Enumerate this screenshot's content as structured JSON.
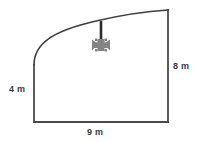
{
  "figure": {
    "background_color": "#ffffff",
    "outline_color": "#4a4a4a",
    "marker_color": "#808080",
    "text_color": "#3a3a3a",
    "labels": {
      "left_side": "4 m",
      "right_side": "8 m",
      "bottom_side": "9 m"
    },
    "icons": {
      "pointer_line": "vertical-pointer-line",
      "burst": "star-burst-marker"
    },
    "geometry": {
      "bottom_left": [
        34,
        122
      ],
      "bottom_right": [
        168,
        122
      ],
      "left_top": [
        34,
        64
      ],
      "right_top": [
        168,
        10
      ],
      "curve_control_1": [
        40,
        38
      ],
      "curve_control_2": [
        96,
        17
      ],
      "pointer_x": 101,
      "pointer_top_y": 27,
      "pointer_bottom_y": 43,
      "burst_center": [
        101,
        45
      ]
    }
  }
}
